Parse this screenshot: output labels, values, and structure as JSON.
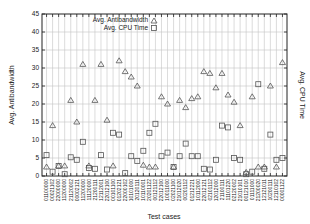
{
  "chart_data": {
    "type": "scatter",
    "title": "",
    "xlabel": "Test cases",
    "ylabel": "Avg. Antibandwidth",
    "y2label": "Avg. CPU Time",
    "ylim": [
      0,
      45
    ],
    "yticks": [
      0,
      5,
      10,
      15,
      20,
      25,
      30,
      35,
      40,
      45
    ],
    "grid": true,
    "legend_position": "top-left-inside",
    "categories": [
      "01100000",
      "00021102",
      "22000000",
      "11200000",
      "21120002",
      "00002121",
      "11200000",
      "11120000",
      "21200111",
      "12112001",
      "22012100",
      "00101100",
      "01202121",
      "22000102",
      "10101000",
      "20120111",
      "10110001",
      "20201122",
      "00121112",
      "22012100",
      "10011000",
      "02021100",
      "21012020",
      "00201112",
      "01212221",
      "10112000",
      "22012121",
      "02101112",
      "12012000",
      "21100111",
      "11101220",
      "02120002",
      "21010101",
      "00121010",
      "01111000",
      "21200020",
      "12121011",
      "10200111",
      "12110102",
      "00001122"
    ],
    "series": [
      {
        "name": "Avg. Antibandwidth",
        "marker": "triangle",
        "values": [
          2.5,
          14,
          2.8,
          2.8,
          21,
          15,
          31,
          2.8,
          21,
          31,
          15.5,
          2.8,
          32,
          29,
          27.5,
          25,
          3,
          2.5,
          2.5,
          22,
          20,
          2.5,
          21,
          19,
          21.5,
          22,
          29,
          28.5,
          24.5,
          28.5,
          22.5,
          20.5,
          14,
          1,
          22,
          2.5,
          2.5,
          25,
          2.5,
          31.5
        ]
      },
      {
        "name": "Avg. CPU Time",
        "marker": "square",
        "values": [
          5.8,
          1.2,
          2.8,
          0.5,
          5.2,
          4.5,
          9.5,
          2.2,
          2,
          5.8,
          1.8,
          12,
          11.5,
          0.8,
          5.5,
          4.2,
          7,
          12,
          14.5,
          5.5,
          6.5,
          2.5,
          5.5,
          9,
          5.5,
          5.5,
          2,
          1.8,
          4.5,
          14,
          13.5,
          5,
          4.5,
          0.5,
          1.2,
          25.5,
          2,
          11.5,
          4.5,
          5
        ]
      }
    ]
  },
  "legend": {
    "items": [
      {
        "label": "Avg. Antibandwidth",
        "marker": "triangle"
      },
      {
        "label": "Avg. CPU Time",
        "marker": "square"
      }
    ]
  },
  "colors": {
    "axis": "#222222",
    "grid": "#b8b8b8",
    "marker": "#555555"
  }
}
